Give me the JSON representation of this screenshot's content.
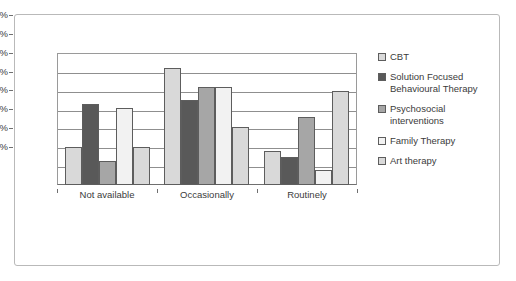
{
  "chart_data": {
    "type": "bar",
    "title": "",
    "xlabel": "",
    "ylabel": "",
    "ylim": [
      0,
      70
    ],
    "ytick_labels": [
      "0%",
      "10%",
      "20%",
      "30%",
      "40%",
      "50%",
      "60%",
      "70%"
    ],
    "ytick_values": [
      0,
      10,
      20,
      30,
      40,
      50,
      60,
      70
    ],
    "grid": true,
    "legend_position": "right",
    "categories": [
      "Not available",
      "Occasionally",
      "Routinely"
    ],
    "series": [
      {
        "name": "CBT",
        "color": "#d9d9d9",
        "values": [
          20,
          62,
          18
        ]
      },
      {
        "name": "Solution Focused Behavioural Therapy",
        "color": "#595959",
        "values": [
          43,
          45,
          15
        ]
      },
      {
        "name": "Psychosocial interventions",
        "color": "#a6a6a6",
        "values": [
          13,
          52,
          36
        ]
      },
      {
        "name": "Family Therapy",
        "color": "#f2f2f2",
        "values": [
          41,
          52,
          8
        ]
      },
      {
        "name": "Art therapy",
        "color": "#d9d9d9",
        "values": [
          20,
          31,
          50
        ]
      }
    ]
  }
}
